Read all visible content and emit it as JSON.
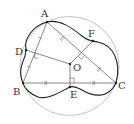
{
  "diagram": {
    "type": "geometry",
    "labels": {
      "A": "A",
      "B": "B",
      "C": "C",
      "D": "D",
      "E": "E",
      "F": "F",
      "O": "O"
    },
    "colors": {
      "circle": "#999999",
      "curve": "#222222",
      "lines": "#555555"
    }
  }
}
